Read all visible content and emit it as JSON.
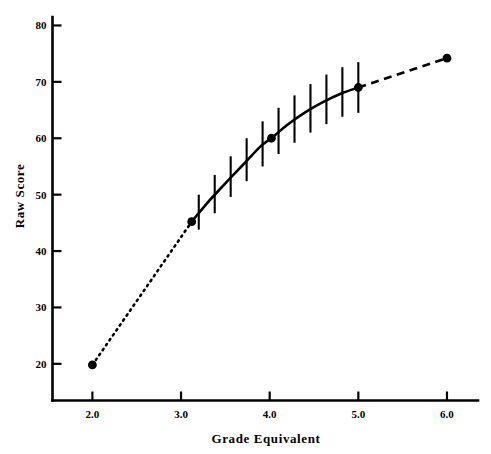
{
  "chart_data": {
    "type": "line",
    "title": "",
    "xlabel": "Grade Equivalent",
    "ylabel": "Raw Score",
    "xlim": [
      1.55,
      6.35
    ],
    "ylim": [
      13.5,
      81.5
    ],
    "xticks": [
      "2.0",
      "3.0",
      "4.0",
      "5.0",
      "6.0"
    ],
    "xtick_values": [
      2.0,
      3.0,
      4.0,
      5.0,
      6.0
    ],
    "yticks": [
      "20",
      "30",
      "40",
      "50",
      "60",
      "70",
      "80"
    ],
    "ytick_values": [
      20,
      30,
      40,
      50,
      60,
      70,
      80
    ],
    "grid": false,
    "legend": "none",
    "series": [
      {
        "name": "extrapolated-lower",
        "style": "dotted",
        "x": [
          2.0,
          3.12
        ],
        "y": [
          19.8,
          45.2
        ]
      },
      {
        "name": "fitted-with-error-bars",
        "style": "solid",
        "x": [
          3.12,
          3.3,
          3.5,
          3.7,
          3.9,
          4.02,
          4.2,
          4.4,
          4.6,
          4.8,
          5.0
        ],
        "y": [
          45.2,
          48.6,
          52.0,
          55.3,
          58.6,
          60.0,
          62.4,
          64.6,
          66.4,
          67.9,
          69.0
        ]
      },
      {
        "name": "extrapolated-upper",
        "style": "dashed",
        "x": [
          5.0,
          6.0
        ],
        "y": [
          69.0,
          74.2
        ]
      }
    ],
    "error_bars": {
      "x": [
        3.2,
        3.38,
        3.56,
        3.74,
        3.92,
        4.1,
        4.28,
        4.46,
        4.64,
        4.82,
        5.0
      ],
      "y": [
        46.9,
        50.1,
        53.2,
        56.2,
        59.0,
        61.3,
        63.4,
        65.3,
        66.9,
        68.2,
        69.0
      ],
      "half_height": [
        3.1,
        3.4,
        3.6,
        3.8,
        4.0,
        4.1,
        4.2,
        4.3,
        4.4,
        4.4,
        4.5
      ]
    },
    "markers": {
      "name": "anchor-points",
      "x": [
        2.0,
        3.12,
        4.02,
        5.0,
        6.0
      ],
      "y": [
        19.8,
        45.2,
        60.0,
        69.0,
        74.2
      ],
      "shape": "filled-circle",
      "color": "#000000"
    }
  }
}
